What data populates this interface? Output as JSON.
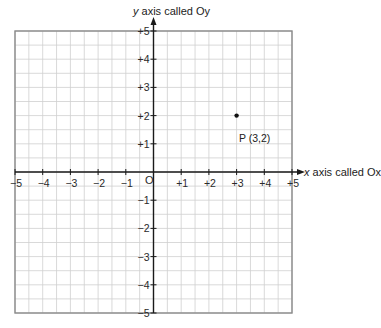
{
  "diagram": {
    "type": "cartesian-coordinate-grid",
    "x_axis": {
      "title_var": "x",
      "title_text": "axis called Ox",
      "min": -5,
      "max": 5,
      "tick_labels": [
        "−5",
        "−4",
        "−3",
        "−2",
        "−1",
        "+1",
        "+2",
        "+3",
        "+4",
        "+5"
      ],
      "tick_values": [
        -5,
        -4,
        -3,
        -2,
        -1,
        1,
        2,
        3,
        4,
        5
      ]
    },
    "y_axis": {
      "title_var": "y",
      "title_text": "axis called Oy",
      "min": -5,
      "max": 5,
      "tick_labels": [
        "+5",
        "+4",
        "+3",
        "+2",
        "+1",
        "−1",
        "−2",
        "−3",
        "−4",
        "−5"
      ],
      "tick_values": [
        5,
        4,
        3,
        2,
        1,
        -1,
        -2,
        -3,
        -4,
        -5
      ]
    },
    "origin_label": "O",
    "grid_minor_step": 0.5,
    "points": [
      {
        "name": "P",
        "label": "P (3,2)",
        "x": 3,
        "y": 2
      }
    ],
    "colors": {
      "grid": "#cfcfcf",
      "border": "#8a8a8a",
      "axis": "#1a1a1a",
      "point": "#111111"
    }
  }
}
